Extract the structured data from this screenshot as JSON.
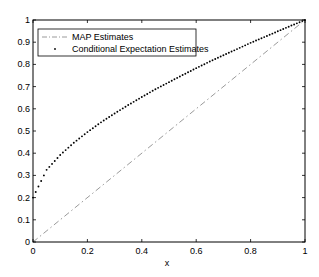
{
  "chart_data": {
    "type": "scatter",
    "title": "",
    "xlabel": "x",
    "ylabel": "",
    "xlim": [
      0,
      1
    ],
    "ylim": [
      0,
      1
    ],
    "grid": false,
    "legend_position": "upper-left",
    "x_ticks": [
      "0",
      "0.2",
      "0.4",
      "0.6",
      "0.8",
      "1"
    ],
    "y_ticks": [
      "0",
      "0.1",
      "0.2",
      "0.3",
      "0.4",
      "0.5",
      "0.6",
      "0.7",
      "0.8",
      "0.9",
      "1"
    ],
    "series": [
      {
        "name": "MAP Estimates",
        "style": "dash-dot line",
        "color": "#9a9a9a",
        "x": [
          0,
          1
        ],
        "y": [
          0,
          1
        ]
      },
      {
        "name": "Conditional Expectation Estimates",
        "style": "dots",
        "color": "#000000",
        "x": [
          0,
          0.05,
          0.1,
          0.15,
          0.2,
          0.25,
          0.3,
          0.35,
          0.4,
          0.45,
          0.5,
          0.55,
          0.6,
          0.65,
          0.7,
          0.75,
          0.8,
          0.85,
          0.9,
          0.95,
          1
        ],
        "y": [
          0.2,
          0.325,
          0.392,
          0.447,
          0.495,
          0.539,
          0.579,
          0.617,
          0.653,
          0.688,
          0.72,
          0.752,
          0.783,
          0.813,
          0.841,
          0.869,
          0.897,
          0.923,
          0.949,
          0.975,
          1.0
        ]
      }
    ]
  }
}
